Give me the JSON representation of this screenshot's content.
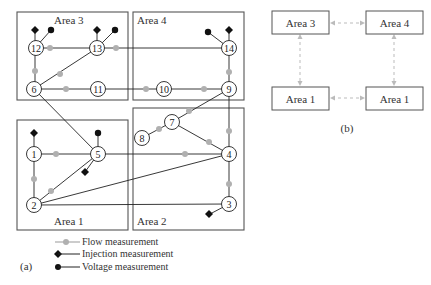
{
  "diagram_a": {
    "caption": "(a)",
    "areas": [
      {
        "id": "area3",
        "label": "Area 3"
      },
      {
        "id": "area4",
        "label": "Area 4"
      },
      {
        "id": "area1",
        "label": "Area 1"
      },
      {
        "id": "area2",
        "label": "Area 2"
      }
    ],
    "nodes": [
      {
        "id": "1",
        "label": "1",
        "area": "Area 1"
      },
      {
        "id": "2",
        "label": "2",
        "area": "Area 1"
      },
      {
        "id": "3",
        "label": "3",
        "area": "Area 2"
      },
      {
        "id": "4",
        "label": "4",
        "area": "Area 2"
      },
      {
        "id": "5",
        "label": "5",
        "area": "Area 1"
      },
      {
        "id": "6",
        "label": "6",
        "area": "Area 3"
      },
      {
        "id": "7",
        "label": "7",
        "area": "Area 2"
      },
      {
        "id": "8",
        "label": "8",
        "area": "Area 2"
      },
      {
        "id": "9",
        "label": "9",
        "area": "Area 4"
      },
      {
        "id": "10",
        "label": "10",
        "area": "Area 4"
      },
      {
        "id": "11",
        "label": "11",
        "area": "Area 3"
      },
      {
        "id": "12",
        "label": "12",
        "area": "Area 3"
      },
      {
        "id": "13",
        "label": "13",
        "area": "Area 3"
      },
      {
        "id": "14",
        "label": "14",
        "area": "Area 4"
      }
    ],
    "edges": [
      [
        "12",
        "13"
      ],
      [
        "13",
        "14"
      ],
      [
        "12",
        "6"
      ],
      [
        "13",
        "6"
      ],
      [
        "6",
        "11"
      ],
      [
        "11",
        "10"
      ],
      [
        "10",
        "9"
      ],
      [
        "14",
        "9"
      ],
      [
        "6",
        "5"
      ],
      [
        "9",
        "7"
      ],
      [
        "7",
        "8"
      ],
      [
        "7",
        "4"
      ],
      [
        "9",
        "4"
      ],
      [
        "1",
        "5"
      ],
      [
        "5",
        "4"
      ],
      [
        "1",
        "2"
      ],
      [
        "2",
        "5"
      ],
      [
        "2",
        "4"
      ],
      [
        "2",
        "3"
      ],
      [
        "4",
        "3"
      ]
    ],
    "legend": {
      "flow": "Flow measurement",
      "injection": "Injection measurement",
      "voltage": "Voltage measurement"
    }
  },
  "diagram_b": {
    "caption": "(b)",
    "boxes": [
      {
        "label": "Area 3"
      },
      {
        "label": "Area 4"
      },
      {
        "label": "Area 1"
      },
      {
        "label": "Area 1"
      }
    ]
  }
}
